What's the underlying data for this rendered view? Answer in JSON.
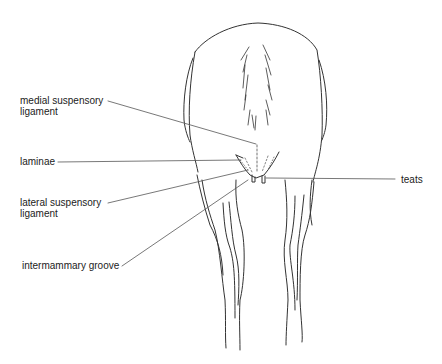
{
  "diagram": {
    "labels": [
      {
        "id": "medial",
        "line1": "medial suspensory",
        "line2": "ligament"
      },
      {
        "id": "laminae",
        "line1": "laminae"
      },
      {
        "id": "lateral",
        "line1": "lateral suspensory",
        "line2": "ligament"
      },
      {
        "id": "groove",
        "line1": "intermammary groove"
      },
      {
        "id": "teats",
        "line1": "teats"
      }
    ],
    "colors": {
      "line": "#333333",
      "leader": "#555555",
      "text": "#222222",
      "background": "#ffffff"
    }
  }
}
